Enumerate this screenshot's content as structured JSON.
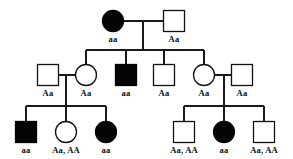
{
  "diagram": {
    "kind": "pedigree-chart",
    "background_color": "#ffffff",
    "line_color": "#1a1a1a",
    "affected_fill": "#050505",
    "unaffected_fill": "#ffffff",
    "legend": {
      "filled_shape_meaning": "affected",
      "open_shape_meaning": "unaffected",
      "square_meaning": "male",
      "circle_meaning": "female"
    },
    "generations": [
      {
        "id": "I",
        "individuals": [
          {
            "id": "I-1",
            "shape": "circle",
            "sex": "female",
            "filled": true,
            "genotype": "aa",
            "cx": 113,
            "cy": 21
          },
          {
            "id": "I-2",
            "shape": "square",
            "sex": "male",
            "filled": false,
            "genotype": "Aa",
            "cx": 174,
            "cy": 21
          }
        ]
      },
      {
        "id": "II",
        "individuals": [
          {
            "id": "II-1",
            "shape": "square",
            "sex": "male",
            "filled": false,
            "genotype": "Aa",
            "cx": 48,
            "cy": 75
          },
          {
            "id": "II-2",
            "shape": "circle",
            "sex": "female",
            "filled": false,
            "genotype": "Aa",
            "cx": 86,
            "cy": 75
          },
          {
            "id": "II-3",
            "shape": "square",
            "sex": "male",
            "filled": true,
            "genotype": "aa",
            "cx": 126,
            "cy": 75
          },
          {
            "id": "II-4",
            "shape": "square",
            "sex": "male",
            "filled": false,
            "genotype": "Aa",
            "cx": 164,
            "cy": 75
          },
          {
            "id": "II-5",
            "shape": "circle",
            "sex": "female",
            "filled": false,
            "genotype": "Aa",
            "cx": 204,
            "cy": 75
          },
          {
            "id": "II-6",
            "shape": "square",
            "sex": "male",
            "filled": false,
            "genotype": "Aa",
            "cx": 242,
            "cy": 75
          }
        ]
      },
      {
        "id": "III",
        "individuals": [
          {
            "id": "III-1",
            "shape": "square",
            "sex": "male",
            "filled": true,
            "genotype": "aa",
            "cx": 26,
            "cy": 132
          },
          {
            "id": "III-2",
            "shape": "circle",
            "sex": "female",
            "filled": false,
            "genotype": "Aa, AA",
            "cx": 66,
            "cy": 132
          },
          {
            "id": "III-3",
            "shape": "circle",
            "sex": "female",
            "filled": true,
            "genotype": "aa",
            "cx": 106,
            "cy": 132
          },
          {
            "id": "III-4",
            "shape": "square",
            "sex": "male",
            "filled": false,
            "genotype": "Aa, AA",
            "cx": 184,
            "cy": 132
          },
          {
            "id": "III-5",
            "shape": "circle",
            "sex": "female",
            "filled": true,
            "genotype": "aa",
            "cx": 224,
            "cy": 132
          },
          {
            "id": "III-6",
            "shape": "square",
            "sex": "male",
            "filled": false,
            "genotype": "Aa, AA",
            "cx": 264,
            "cy": 132
          }
        ]
      }
    ],
    "matings": [
      {
        "id": "mating-I",
        "partners": [
          "I-1",
          "I-2"
        ],
        "children": [
          "II-2",
          "II-3",
          "II-4",
          "II-5"
        ]
      },
      {
        "id": "mating-II-left",
        "partners": [
          "II-1",
          "II-2"
        ],
        "children": [
          "III-1",
          "III-2",
          "III-3"
        ]
      },
      {
        "id": "mating-II-right",
        "partners": [
          "II-5",
          "II-6"
        ],
        "children": [
          "III-4",
          "III-5",
          "III-6"
        ]
      }
    ]
  }
}
